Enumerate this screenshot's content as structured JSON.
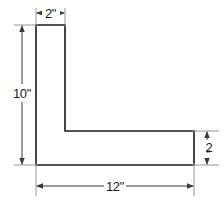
{
  "figure": {
    "shape_name": "l-shape",
    "units": "inches",
    "colors": {
      "background": "#ffffff",
      "shape_fill": "#ffffff",
      "shape_stroke": "#1a1a1a",
      "dimension_line": "#3a3a3a",
      "extension_line": "#8a8a8a",
      "text": "#1a1a1a"
    },
    "dimensions": [
      {
        "id": "top-width",
        "label": "2\"",
        "value": 2,
        "placement": "top",
        "orientation": "horizontal",
        "describes": "width of the vertical leg"
      },
      {
        "id": "left-height",
        "label": "10\"",
        "value": 10,
        "placement": "left",
        "orientation": "vertical",
        "describes": "overall height of the L"
      },
      {
        "id": "bottom-width",
        "label": "12\"",
        "value": 12,
        "placement": "bottom",
        "orientation": "horizontal",
        "describes": "overall width of the L"
      },
      {
        "id": "right-height",
        "label": "2\"",
        "value": 2,
        "placement": "right",
        "orientation": "vertical",
        "describes": "thickness of the horizontal leg"
      }
    ],
    "right_label_chars": {
      "digit": "2",
      "inch_mark": "\""
    }
  }
}
